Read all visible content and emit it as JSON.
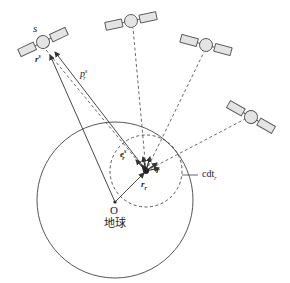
{
  "diagram": {
    "type": "GNSS positioning geometry",
    "labels": {
      "satellite": "s",
      "satellite_position": "r",
      "satellite_position_sup": "s",
      "pseudorange": "p",
      "pseudorange_sup": "s",
      "pseudorange_sub": "r",
      "unit_vector": "e",
      "unit_vector_sup": "s",
      "unit_vector_sub": "r",
      "receiver_vector": "r",
      "receiver_vector_sub": "r",
      "position_correction": "r",
      "clock_bias": "cdt",
      "clock_bias_sub": "r",
      "earth_center": "O",
      "earth": "地球"
    },
    "satellites": [
      {
        "id": "s",
        "x": 43,
        "y": 42,
        "angle": -25
      },
      {
        "id": "sat2",
        "x": 131,
        "y": 21,
        "angle": -12
      },
      {
        "id": "sat3",
        "x": 206,
        "y": 45,
        "angle": 15
      },
      {
        "id": "sat4",
        "x": 251,
        "y": 117,
        "angle": 30
      }
    ],
    "receiver": {
      "x": 146,
      "y": 171
    },
    "earth": {
      "cx": 115,
      "cy": 200,
      "r": 78
    },
    "clock_circle": {
      "cx": 146,
      "cy": 171,
      "r": 36
    },
    "colors": {
      "line": "#333333",
      "satellite_fill": "#e4e4e4",
      "satellite_stroke": "#555555"
    }
  }
}
